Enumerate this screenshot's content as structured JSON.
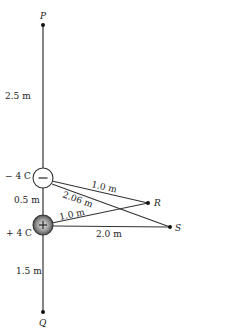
{
  "diagram": {
    "type": "physics-charges",
    "points": {
      "P": {
        "label": "P",
        "x": 43,
        "y": 25
      },
      "Q": {
        "label": "Q",
        "x": 43,
        "y": 312
      },
      "R": {
        "label": "R",
        "x": 148,
        "y": 203
      },
      "S": {
        "label": "S",
        "x": 170,
        "y": 227
      }
    },
    "charges": {
      "negative": {
        "label": "− 4 C",
        "sign": "−",
        "x": 43,
        "y": 178,
        "r": 10
      },
      "positive": {
        "label": "+ 4 C",
        "sign": "+",
        "x": 43,
        "y": 225,
        "r": 10
      }
    },
    "distances": {
      "P_to_neg": "2.5 m",
      "neg_to_pos": "0.5 m",
      "pos_to_Q": "1.5 m",
      "neg_to_R": "1.0 m",
      "neg_to_S": "2.06 m",
      "pos_to_R": "1.0 m",
      "pos_to_S": "2.0 m"
    }
  }
}
